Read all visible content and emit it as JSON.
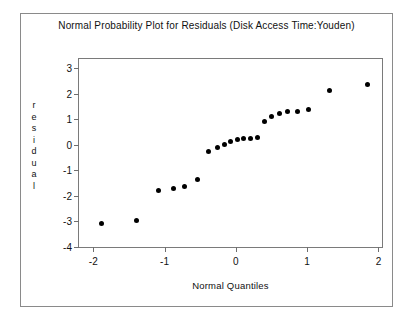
{
  "chart_data": {
    "type": "scatter",
    "title": "Normal Probability Plot for Residuals (Disk Access Time:Youden)",
    "xlabel": "Normal Quantiles",
    "ylabel": "residual",
    "ylabel_letters": [
      "r",
      "e",
      "s",
      "i",
      "d",
      "u",
      "a",
      "l"
    ],
    "xlim": [
      -2.2,
      2.05
    ],
    "ylim": [
      -4.0,
      3.35
    ],
    "xticks": [
      -2,
      -1,
      0,
      1,
      2
    ],
    "xtick_labels": [
      "-2",
      "-1",
      "0",
      "1",
      "2"
    ],
    "yticks": [
      -4,
      -3,
      -2,
      -1,
      0,
      1,
      2,
      3
    ],
    "ytick_labels": [
      "-4",
      "-3",
      "-2",
      "-1",
      "0",
      "1",
      "2",
      "3"
    ],
    "grid": false,
    "legend": false,
    "marker": "filled-circle",
    "marker_color": "#000000",
    "marker_size_px": 5,
    "x": [
      -1.88,
      -1.4,
      -1.08,
      -0.88,
      -0.72,
      -0.54,
      -0.38,
      -0.26,
      -0.16,
      -0.07,
      0.02,
      0.11,
      0.2,
      0.3,
      0.4,
      0.5,
      0.61,
      0.73,
      0.87,
      1.02,
      1.32,
      1.85
    ],
    "y": [
      -3.1,
      -2.95,
      -1.78,
      -1.72,
      -1.62,
      -1.35,
      -0.28,
      -0.1,
      0.02,
      0.12,
      0.2,
      0.24,
      0.26,
      0.3,
      0.92,
      1.12,
      1.2,
      1.28,
      1.3,
      1.38,
      2.12,
      2.35
    ],
    "n_points": 22
  },
  "colors": {
    "background": "#ffffff",
    "frame": "#8a8a8a",
    "axis": "#7a7a7a",
    "text": "#111111",
    "marker": "#000000"
  }
}
